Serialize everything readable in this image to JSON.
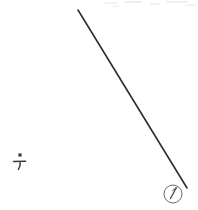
{
  "canvas": {
    "width": 198,
    "height": 210,
    "background_color": "#ffffff"
  },
  "artwork": {
    "title": "Diagonal line with handwritten annotations",
    "stroke_color": "#2e2e30",
    "faint_color": "#f1f1f2"
  },
  "elements": {
    "diagonal_line": {
      "name": "diagonal-line",
      "x1": 78,
      "y1": 10,
      "x2": 187,
      "y2": 188,
      "stroke_width": 1.6,
      "color": "#2e2e30"
    },
    "left_mark": {
      "name": "dot-over-tee-mark",
      "label": "⊤",
      "dot_x": 20,
      "dot_y": 156,
      "glyph_x": 20,
      "glyph_y": 164,
      "color": "#3a3a3c"
    },
    "circled_number": {
      "name": "circled-number-one",
      "label": "1",
      "center_x": 173,
      "center_y": 194,
      "radius": 9,
      "color": "#5a5a5e"
    },
    "top_edge_artifacts": {
      "name": "top-edge-smudges",
      "count": 6,
      "color": "#f1f1f2"
    }
  }
}
